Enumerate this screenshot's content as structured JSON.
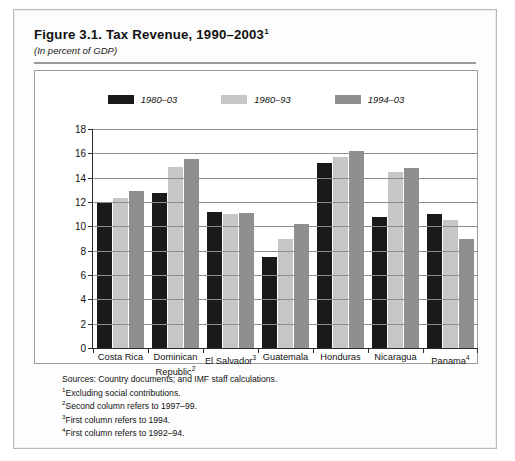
{
  "figure": {
    "title": "Figure 3.1.  Tax Revenue, 1990–2003",
    "title_superscript": "1",
    "subtitle": "(In percent of GDP)"
  },
  "chart_data": {
    "type": "bar",
    "title": "Figure 3.1.  Tax Revenue, 1990–2003",
    "subtitle": "(In percent of GDP)",
    "xlabel": "",
    "ylabel": "In percent of GDP",
    "ylim": [
      0,
      18
    ],
    "ytick_step": 2,
    "yticks": [
      "18",
      "16",
      "14",
      "12",
      "10",
      "8",
      "6",
      "4",
      "2",
      "0"
    ],
    "grid": true,
    "legend_position": "top-center",
    "categories": [
      "Costa Rica",
      "Dominican Republic",
      "El Salvador",
      "Guatemala",
      "Honduras",
      "Nicaragua",
      "Panama"
    ],
    "category_superscripts": [
      "",
      "2",
      "3",
      "",
      "",
      "",
      "4"
    ],
    "series": [
      {
        "name": "1980–03",
        "color": "#1a1a1a",
        "values": [
          12.0,
          12.7,
          11.2,
          7.5,
          15.2,
          10.8,
          11.0
        ]
      },
      {
        "name": "1980–93",
        "color": "#c6c6c6",
        "values": [
          12.3,
          14.9,
          11.0,
          9.0,
          15.7,
          14.5,
          10.5
        ]
      },
      {
        "name": "1994–03",
        "color": "#8f8f8f",
        "values": [
          12.9,
          15.5,
          11.1,
          10.2,
          16.2,
          14.8,
          9.0
        ]
      }
    ]
  },
  "notes": [
    {
      "sup": "",
      "text": "Sources: Country documents; and IMF staff calculations."
    },
    {
      "sup": "1",
      "text": "Excluding social contributions."
    },
    {
      "sup": "2",
      "text": "Second column refers to 1997–99."
    },
    {
      "sup": "3",
      "text": "First column refers to 1994."
    },
    {
      "sup": "4",
      "text": "First column refers to 1992–94."
    }
  ]
}
